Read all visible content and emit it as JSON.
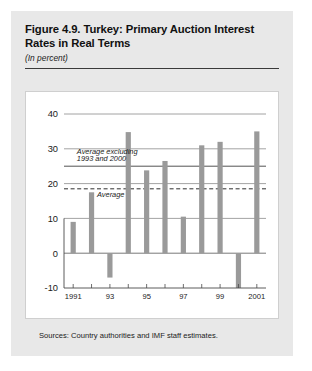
{
  "figure": {
    "title": "Figure 4.9. Turkey: Primary Auction Interest Rates in Real Terms",
    "subtitle": "(In percent)",
    "source_note": "Sources: Country authorities and IMF staff estimates."
  },
  "chart_data": {
    "type": "bar",
    "title": "Figure 4.9. Turkey: Primary Auction Interest Rates in Real Terms",
    "subtitle": "(In percent)",
    "xlabel": "",
    "ylabel": "",
    "ylim": [
      -10,
      40
    ],
    "yticks": [
      -10,
      0,
      10,
      20,
      30,
      40
    ],
    "ytick_labels": [
      "-10",
      "0",
      "10",
      "20",
      "30",
      "40"
    ],
    "grid": true,
    "legend": "none",
    "categories": [
      1991,
      1992,
      1993,
      1994,
      1995,
      1996,
      1997,
      1998,
      1999,
      2000,
      2001
    ],
    "xtick_labels": [
      "1991",
      "",
      "93",
      "",
      "95",
      "",
      "97",
      "",
      "99",
      "",
      "2001"
    ],
    "values": [
      9,
      17.5,
      -7,
      34.8,
      23.8,
      26.5,
      10.5,
      31,
      32,
      -10,
      35
    ],
    "bar_color": "#9a9a9a",
    "reference_lines": [
      {
        "label": "Average excluding 1993 and 2000",
        "value": 25,
        "style": "solid",
        "color": "#3f3f3f"
      },
      {
        "label": "Average",
        "value": 18.5,
        "style": "dashed",
        "color": "#2e2e2e"
      }
    ],
    "annotations": [
      {
        "text": "Average excluding",
        "x": 1991.2,
        "y": 28.6
      },
      {
        "text": "1993 and 2000",
        "x": 1991.2,
        "y": 26.4
      },
      {
        "text": "Average",
        "x": 1992.3,
        "y": 16.2
      }
    ]
  }
}
